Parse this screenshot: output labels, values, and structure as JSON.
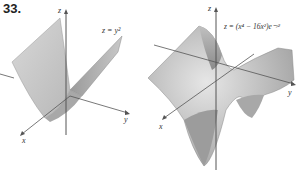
{
  "figures": [
    {
      "number": "33.",
      "equation": "z = y²",
      "axes": {
        "x": "x",
        "y": "y",
        "z": "z"
      }
    },
    {
      "number": "35.",
      "equation": "z = (x⁴ − 16x²)e⁻ʸ²",
      "axes": {
        "x": "x",
        "y": "y",
        "z": "z"
      }
    }
  ]
}
